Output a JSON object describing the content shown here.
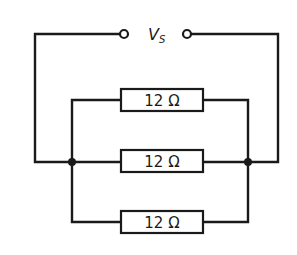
{
  "diagram": {
    "type": "parallel-resistor-circuit",
    "source": {
      "label": "V",
      "subscript": "S"
    },
    "resistors": [
      {
        "label": "12 Ω",
        "value": 12,
        "unit": "Ω",
        "position": "top"
      },
      {
        "label": "12 Ω",
        "value": 12,
        "unit": "Ω",
        "position": "middle"
      },
      {
        "label": "12 Ω",
        "value": 12,
        "unit": "Ω",
        "position": "bottom"
      }
    ],
    "colors": {
      "line": "#1a1a1a",
      "background": "#ffffff"
    }
  }
}
